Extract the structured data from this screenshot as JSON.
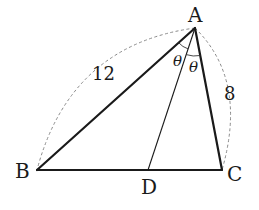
{
  "diagram": {
    "type": "triangle-angle-bisector",
    "vertices": {
      "A": {
        "label": "A",
        "x": 195,
        "y": 28
      },
      "B": {
        "label": "B",
        "x": 37,
        "y": 170
      },
      "C": {
        "label": "C",
        "x": 222,
        "y": 170
      },
      "D": {
        "label": "D",
        "x": 148,
        "y": 170
      }
    },
    "sides": {
      "AB": {
        "length_label": "12"
      },
      "AC": {
        "length_label": "8"
      }
    },
    "angles": {
      "BAD": {
        "label": "θ"
      },
      "DAC": {
        "label": "θ"
      }
    },
    "colors": {
      "line": "#1a1a1a",
      "dashed_arc": "#8a8a8a",
      "background": "#ffffff"
    }
  }
}
